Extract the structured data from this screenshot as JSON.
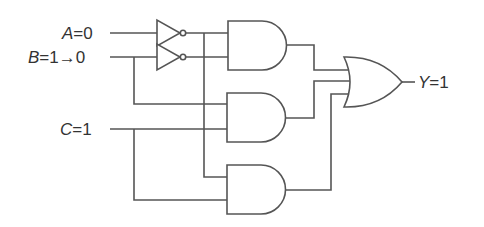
{
  "diagram": {
    "type": "logic-circuit",
    "inputs": [
      {
        "name": "A",
        "eq": "=",
        "value": "0",
        "label": "A = 0"
      },
      {
        "name": "B",
        "eq": "=",
        "value": "1",
        "arrow": "→",
        "new_value": "0",
        "label": "B = 1→0"
      },
      {
        "name": "C",
        "eq": "=",
        "value": "1",
        "label": "C = 1"
      }
    ],
    "output": {
      "name": "Y",
      "eq": "=",
      "value": "1",
      "label": "Y = 1"
    },
    "gates": [
      {
        "id": "not-a",
        "type": "NOT",
        "input": "A"
      },
      {
        "id": "not-b",
        "type": "NOT",
        "input": "B"
      },
      {
        "id": "and-1",
        "type": "AND",
        "inputs": [
          "A'",
          "B'"
        ]
      },
      {
        "id": "and-2",
        "type": "AND",
        "inputs": [
          "B",
          "C"
        ]
      },
      {
        "id": "and-3",
        "type": "AND",
        "inputs": [
          "A'",
          "C"
        ]
      },
      {
        "id": "or-1",
        "type": "OR",
        "inputs": [
          "and-1",
          "and-2",
          "and-3"
        ],
        "output": "Y"
      }
    ],
    "colors": {
      "line": "#555555",
      "text": "#333333",
      "background": "#ffffff"
    }
  }
}
